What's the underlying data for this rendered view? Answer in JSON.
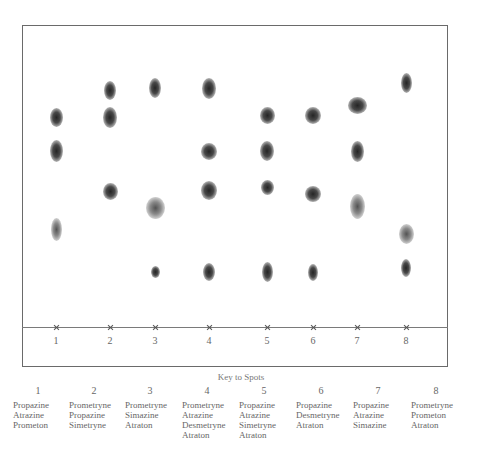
{
  "figure": {
    "type": "thin-layer chromatogram",
    "lanes": [
      {
        "number": "1",
        "x": 56,
        "spots": [
          {
            "y": 117,
            "w": 13,
            "h": 19
          },
          {
            "y": 151,
            "w": 13,
            "h": 22
          },
          {
            "y": 229,
            "w": 11,
            "h": 23,
            "faint": true
          }
        ]
      },
      {
        "number": "2",
        "x": 110,
        "spots": [
          {
            "y": 90,
            "w": 12,
            "h": 19
          },
          {
            "y": 117,
            "w": 14,
            "h": 21
          },
          {
            "y": 191,
            "w": 15,
            "h": 17
          }
        ]
      },
      {
        "number": "3",
        "x": 155,
        "spots": [
          {
            "y": 88,
            "w": 12,
            "h": 20
          },
          {
            "y": 208,
            "w": 19,
            "h": 22,
            "faint": true
          },
          {
            "y": 272,
            "w": 9,
            "h": 12
          }
        ]
      },
      {
        "number": "4",
        "x": 209,
        "spots": [
          {
            "y": 88,
            "w": 14,
            "h": 21
          },
          {
            "y": 151,
            "w": 16,
            "h": 17
          },
          {
            "y": 190,
            "w": 16,
            "h": 19
          },
          {
            "y": 272,
            "w": 12,
            "h": 18
          }
        ]
      },
      {
        "number": "5",
        "x": 267,
        "spots": [
          {
            "y": 115,
            "w": 15,
            "h": 17
          },
          {
            "y": 151,
            "w": 14,
            "h": 20
          },
          {
            "y": 187,
            "w": 13,
            "h": 15
          },
          {
            "y": 272,
            "w": 11,
            "h": 20
          }
        ]
      },
      {
        "number": "6",
        "x": 313,
        "spots": [
          {
            "y": 115,
            "w": 16,
            "h": 17
          },
          {
            "y": 194,
            "w": 16,
            "h": 16
          },
          {
            "y": 272,
            "w": 10,
            "h": 17
          }
        ]
      },
      {
        "number": "7",
        "x": 357,
        "spots": [
          {
            "y": 105,
            "w": 19,
            "h": 17
          },
          {
            "y": 151,
            "w": 13,
            "h": 21
          },
          {
            "y": 206,
            "w": 15,
            "h": 25,
            "faint": true
          }
        ]
      },
      {
        "number": "8",
        "x": 406,
        "spots": [
          {
            "y": 83,
            "w": 11,
            "h": 20
          },
          {
            "y": 234,
            "w": 15,
            "h": 20,
            "faint": true
          },
          {
            "y": 268,
            "w": 10,
            "h": 18
          }
        ]
      }
    ]
  },
  "key": {
    "title": "Key to Spots",
    "columns": [
      {
        "number": "1",
        "x": 13,
        "items": [
          "Propazine",
          "Atrazine",
          "Prometon"
        ]
      },
      {
        "number": "2",
        "x": 69,
        "items": [
          "Prometryne",
          "Propazine",
          "Simetryne"
        ]
      },
      {
        "number": "3",
        "x": 125,
        "items": [
          "Prometryne",
          "Simazine",
          "Atraton"
        ]
      },
      {
        "number": "4",
        "x": 182,
        "items": [
          "Prometryne",
          "Atrazine",
          "Desmetryne",
          "Atraton"
        ]
      },
      {
        "number": "5",
        "x": 239,
        "items": [
          "Propazine",
          "Atrazine",
          "Simetryne",
          "Atraton"
        ]
      },
      {
        "number": "6",
        "x": 296,
        "items": [
          "Propazine",
          "Desmetryne",
          "Atraton"
        ]
      },
      {
        "number": "7",
        "x": 353,
        "items": [
          "Propazine",
          "Atrazine",
          "Simazine"
        ]
      },
      {
        "number": "8",
        "x": 411,
        "items": [
          "Prometryne",
          "Prometon",
          "Atraton"
        ]
      }
    ]
  }
}
